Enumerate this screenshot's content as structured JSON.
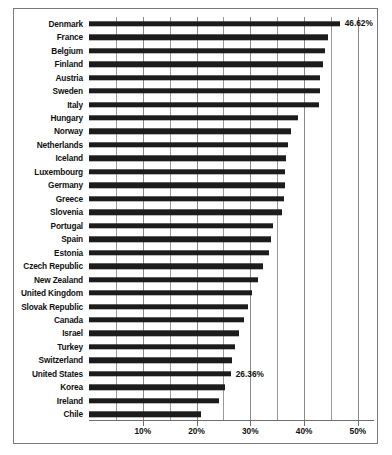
{
  "chart_data": {
    "type": "bar",
    "orientation": "horizontal",
    "title": "",
    "xlabel": "",
    "ylabel": "",
    "xlim": [
      0,
      53
    ],
    "xticks": [
      10,
      20,
      30,
      40,
      50
    ],
    "xtick_labels": [
      "10%",
      "20%",
      "30%",
      "40%",
      "50%"
    ],
    "gridlines": true,
    "gridline_interval": 5,
    "legend": "none",
    "value_format": "percent",
    "bar_color": "#1c1c1c",
    "categories": [
      "Denmark",
      "France",
      "Belgium",
      "Finland",
      "Austria",
      "Sweden",
      "Italy",
      "Hungary",
      "Norway",
      "Netherlands",
      "Iceland",
      "Luxembourg",
      "Germany",
      "Greece",
      "Slovenia",
      "Portugal",
      "Spain",
      "Estonia",
      "Czech Republic",
      "New Zealand",
      "United Kingdom",
      "Slovak Republic",
      "Canada",
      "Israel",
      "Turkey",
      "Switzerland",
      "United States",
      "Korea",
      "Ireland",
      "Chile"
    ],
    "values": [
      46.62,
      44.5,
      43.9,
      43.5,
      43.0,
      42.9,
      42.8,
      38.9,
      37.6,
      37.0,
      36.6,
      36.5,
      36.4,
      36.2,
      35.9,
      34.2,
      33.9,
      33.5,
      32.4,
      31.4,
      30.4,
      29.6,
      28.8,
      27.9,
      27.1,
      26.6,
      26.36,
      25.3,
      24.2,
      20.8
    ],
    "annotated_labels": {
      "Denmark": "46.62%",
      "United States": "26.36%"
    }
  },
  "caption": {
    "text": ""
  }
}
